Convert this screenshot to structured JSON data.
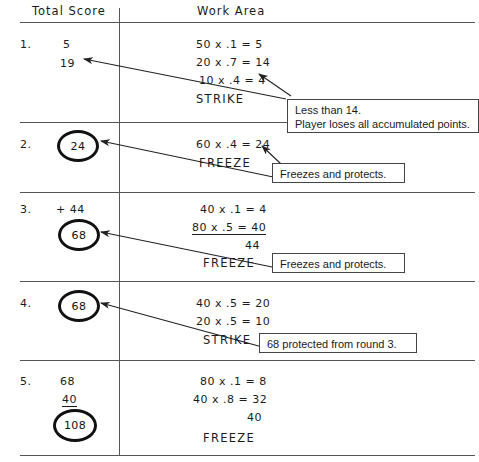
{
  "document": {
    "title": "Total Score and Work Area worksheet",
    "columns": {
      "left_header": "Total Score",
      "right_header": "Work Area"
    }
  },
  "rows": [
    {
      "number": "1.",
      "scores": [
        "5",
        "19"
      ],
      "circled_total": null,
      "work_lines": [
        "50 x .1 = 5",
        "20 x .7 = 14",
        "10 x .4 = 4"
      ],
      "result": "STRIKE"
    },
    {
      "number": "2.",
      "scores": [],
      "circled_total": "24",
      "work_lines": [
        "60 x .4 = 24"
      ],
      "result": "FREEZE"
    },
    {
      "number": "3.",
      "scores": [
        "+ 44"
      ],
      "circled_total": "68",
      "work_lines": [
        "40 x .1 = 4",
        "80 x .5 = 40",
        "44"
      ],
      "result": "FREEZE"
    },
    {
      "number": "4.",
      "scores": [],
      "circled_total": "68",
      "work_lines": [
        "40 x .5 = 20",
        "20 x .5 = 10"
      ],
      "result": "STRIKE"
    },
    {
      "number": "5.",
      "scores": [
        "68",
        "40"
      ],
      "circled_total": "108",
      "work_lines": [
        "80 x .1 = 8",
        "40 x .8 = 32",
        "40"
      ],
      "result": "FREEZE"
    }
  ],
  "callouts": [
    {
      "id": "strike-rule",
      "line1": "Less than 14.",
      "line2": "Player loses all accumulated points."
    },
    {
      "id": "freeze-rule-round2",
      "line1": "Freezes and protects.",
      "line2": ""
    },
    {
      "id": "freeze-rule-round3",
      "line1": "Freezes and protects.",
      "line2": ""
    },
    {
      "id": "protected-note",
      "line1": "68 protected from round 3.",
      "line2": ""
    }
  ],
  "colors": {
    "ink": "#1b1b1b",
    "rule": "#555555",
    "box_border": "#444444",
    "paper": "#ffffff"
  }
}
